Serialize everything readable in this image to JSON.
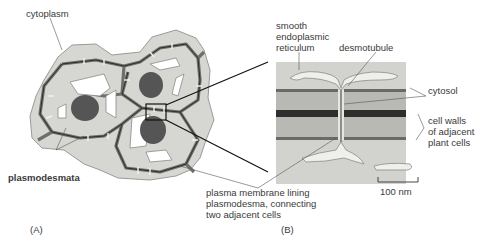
{
  "figure": {
    "panel_a": {
      "panel_label": "(A)",
      "labels": {
        "cytoplasm": "cytoplasm",
        "plasmodesmata": "plasmodesmata"
      }
    },
    "panel_b": {
      "panel_label": "(B)",
      "labels": {
        "ser_line1": "smooth",
        "ser_line2": "endoplasmic",
        "ser_line3": "reticulum",
        "desmotubule": "desmotubule",
        "cytosol": "cytosol",
        "cell_walls_line1": "cell walls",
        "cell_walls_line2": "of adjacent",
        "cell_walls_line3": "plant cells",
        "plasma_line1": "plasma membrane lining",
        "plasma_line2": "plasmodesma, connecting",
        "plasma_line3": "two adjacent cells"
      },
      "scale_bar": "100 nm"
    },
    "colors": {
      "cytoplasm": "#d4d4d0",
      "cell_wall": "#8c8c88",
      "middle_lamella": "#2e2e2e",
      "nucleus": "#555555",
      "vacuole": "#ffffff",
      "text": "#3a3a3a"
    }
  }
}
